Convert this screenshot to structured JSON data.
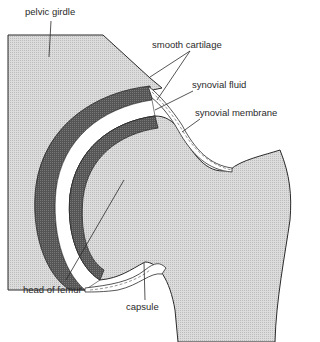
{
  "diagram": {
    "labels": {
      "pelvic_girdle": "pelvic girdle",
      "smooth_cartilage": "smooth cartilage",
      "synovial_fluid": "synovial fluid",
      "synovial_membrane": "synovial membrane",
      "head_of_femur": "head of femur",
      "capsule": "capsule"
    },
    "colors": {
      "bone_fill": "#d4d4d4",
      "cartilage_fill": "#5a5a5a",
      "fluid_fill": "#ffffff",
      "outline": "#2a2a2a"
    }
  }
}
